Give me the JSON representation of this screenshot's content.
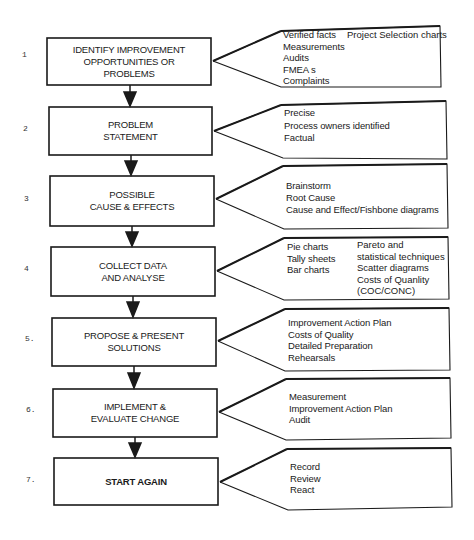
{
  "diagram": {
    "type": "flowchart",
    "steps": [
      {
        "number": "1",
        "title_lines": [
          "IDENTIFY IMPROVEMENT",
          "OPPORTUNITIES OR",
          "PROBLEMS"
        ],
        "notes": [
          "Verified facts",
          "Measurements",
          "Audits",
          "FMEA s",
          "Complaints"
        ],
        "notes_col2": [
          "Project Selection charts"
        ]
      },
      {
        "number": "2",
        "title_lines": [
          "PROBLEM",
          "STATEMENT"
        ],
        "notes": [
          "Precise",
          "Process owners identified",
          "Factual"
        ]
      },
      {
        "number": "3",
        "title_lines": [
          "POSSIBLE",
          "CAUSE & EFFECTS"
        ],
        "notes": [
          "Brainstorm",
          "Root Cause",
          "Cause and Effect/Fishbone diagrams"
        ]
      },
      {
        "number": "4",
        "title_lines": [
          "COLLECT DATA",
          "AND ANALYSE"
        ],
        "notes": [
          "Pie charts",
          "Tally sheets",
          "Bar charts"
        ],
        "notes_col2": [
          "Pareto and",
          "statistical techniques",
          "Scatter diagrams",
          "Costs of Quanlity",
          "(COC/CONC)"
        ]
      },
      {
        "number": "5.",
        "title_lines": [
          "PROPOSE & PRESENT",
          "SOLUTIONS"
        ],
        "notes": [
          "Improvement Action Plan",
          "Costs of Quality",
          "Detailed Preparation",
          "Rehearsals"
        ]
      },
      {
        "number": "6.",
        "title_lines": [
          "IMPLEMENT &",
          "EVALUATE CHANGE"
        ],
        "notes": [
          "Measurement",
          "Improvement Action Plan",
          "Audit"
        ]
      },
      {
        "number": "7.",
        "title_lines": [
          "START AGAIN"
        ],
        "notes": [
          "Record",
          "Review",
          "React"
        ]
      }
    ]
  }
}
